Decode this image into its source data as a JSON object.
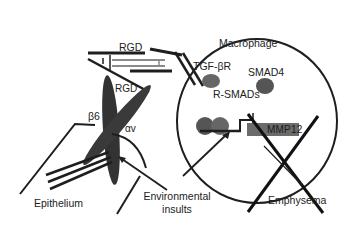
{
  "diagram": {
    "labels": {
      "rgd_top": "RGD",
      "rgd_integrin": "RGD",
      "beta6": "β6",
      "alpha_v": "αv",
      "macrophage": "Macrophage",
      "tgf_beta_r": "TGF-βR",
      "smad4": "SMAD4",
      "r_smads": "R-SMADs",
      "mmp12": "MMP12",
      "epithelium": "Epithelium",
      "environmental_insults_line1": "Environmental",
      "environmental_insults_line2": "insults",
      "emphysema": "Emphysema"
    },
    "colors": {
      "line": "#1e1e1e",
      "integrin": "#3a3a3a",
      "latent_complex": "#8a8a8a",
      "smad_blob": "#555555",
      "mmp12_box": "#6b6b6b",
      "background": "#ffffff"
    }
  }
}
